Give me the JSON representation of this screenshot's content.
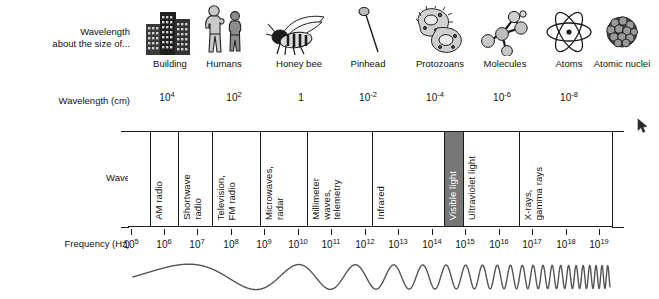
{
  "figure": {
    "background_color": "#ffffff",
    "ink_color": "#111111",
    "visible_light_block_color": "#777777"
  },
  "rows": {
    "size_row_label": "Wavelength\nabout the size of...",
    "wavelength_row_label": "Wavelength (cm)",
    "wave_row_label": "Wave",
    "frequency_row_label": "Frequency (Hz)"
  },
  "size_icons": [
    {
      "icon": "building-icon",
      "caption": "Building",
      "x": 170
    },
    {
      "icon": "humans-icon",
      "caption": "Humans",
      "x": 224
    },
    {
      "icon": "honey-bee-icon",
      "caption": "Honey bee",
      "x": 299
    },
    {
      "icon": "pinhead-icon",
      "caption": "Pinhead",
      "x": 368
    },
    {
      "icon": "protozoans-icon",
      "caption": "Protozoans",
      "x": 440
    },
    {
      "icon": "molecules-icon",
      "caption": "Molecules",
      "x": 505
    },
    {
      "icon": "atoms-icon",
      "caption": "Atoms",
      "x": 569
    },
    {
      "icon": "atomic-nuclei-icon",
      "caption": "Atomic nuclei",
      "x": 622
    }
  ],
  "wavelength_axis": {
    "unit": "cm",
    "ticks": [
      {
        "base": "10",
        "exp": "4",
        "x": 167
      },
      {
        "base": "10",
        "exp": "2",
        "x": 234
      },
      {
        "base": "1",
        "exp": "",
        "x": 301
      },
      {
        "base": "10",
        "exp": "-2",
        "x": 368
      },
      {
        "base": "10",
        "exp": "-4",
        "x": 435
      },
      {
        "base": "10",
        "exp": "-6",
        "x": 502
      },
      {
        "base": "10",
        "exp": "-8",
        "x": 569
      }
    ]
  },
  "frequency_axis": {
    "unit": "Hz",
    "ticks": [
      {
        "base": "10",
        "exp": "5",
        "x": 131
      },
      {
        "base": "10",
        "exp": "6",
        "x": 164
      },
      {
        "base": "10",
        "exp": "7",
        "x": 197
      },
      {
        "base": "10",
        "exp": "8",
        "x": 231
      },
      {
        "base": "10",
        "exp": "9",
        "x": 264
      },
      {
        "base": "10",
        "exp": "10",
        "x": 298
      },
      {
        "base": "10",
        "exp": "11",
        "x": 331
      },
      {
        "base": "10",
        "exp": "12",
        "x": 365
      },
      {
        "base": "10",
        "exp": "13",
        "x": 398
      },
      {
        "base": "10",
        "exp": "14",
        "x": 432
      },
      {
        "base": "10",
        "exp": "15",
        "x": 465
      },
      {
        "base": "10",
        "exp": "16",
        "x": 499
      },
      {
        "base": "10",
        "exp": "17",
        "x": 532
      },
      {
        "base": "10",
        "exp": "18",
        "x": 566
      },
      {
        "base": "10",
        "exp": "19",
        "x": 599
      }
    ]
  },
  "spectrum_bands": [
    {
      "name": "AM radio",
      "label": "AM radio",
      "x_start": 150,
      "x_end": 178,
      "highlight": false
    },
    {
      "name": "Shortwave radio",
      "label": "Shortwave\nradio",
      "x_start": 178,
      "x_end": 212,
      "highlight": false
    },
    {
      "name": "Television, FM radio",
      "label": "Television,\nFM radio",
      "x_start": 212,
      "x_end": 260,
      "highlight": false
    },
    {
      "name": "Microwaves, radar",
      "label": "Microwaves,\nradar",
      "x_start": 260,
      "x_end": 307,
      "highlight": false
    },
    {
      "name": "Millimeter waves telemetry",
      "label": "Millimeter\nwaves,\ntelemetry",
      "x_start": 307,
      "x_end": 372,
      "highlight": false
    },
    {
      "name": "Infrared",
      "label": "Infrared",
      "x_start": 372,
      "x_end": 444,
      "highlight": false
    },
    {
      "name": "Visible light",
      "label": "Visible light",
      "x_start": 444,
      "x_end": 463,
      "highlight": true
    },
    {
      "name": "Ultraviolet light",
      "label": "Ultraviolet light",
      "x_start": 463,
      "x_end": 519,
      "highlight": false
    },
    {
      "name": "X-rays, gamma rays",
      "label": "X-rays,\ngamma rays",
      "x_start": 519,
      "x_end": 613,
      "highlight": false
    }
  ],
  "band_geometry": {
    "left": 128,
    "right": 613,
    "top": 131,
    "bottom": 227
  },
  "wave_illustration": {
    "description": "sine wave with progressively increasing frequency, left to right",
    "x_start": 133,
    "x_end": 610,
    "stroke_color": "#555555"
  },
  "cursor": {
    "icon": "mouse-pointer-icon",
    "x": 637,
    "y": 118
  },
  "chart_data": {
    "type": "diagram",
    "xlabel": "Frequency (Hz) / Wavelength (cm)",
    "ylabel": "",
    "frequency_exponents": [
      5,
      6,
      7,
      8,
      9,
      10,
      11,
      12,
      13,
      14,
      15,
      16,
      17,
      18,
      19
    ],
    "wavelength_exponents": [
      4,
      2,
      0,
      -2,
      -4,
      -6,
      -8
    ],
    "categories": [
      "AM radio",
      "Shortwave radio",
      "Television, FM radio",
      "Microwaves, radar",
      "Millimeter waves, telemetry",
      "Infrared",
      "Visible light",
      "Ultraviolet light",
      "X-rays, gamma rays"
    ],
    "size_comparisons": [
      "Building",
      "Humans",
      "Honey bee",
      "Pinhead",
      "Protozoans",
      "Molecules",
      "Atoms",
      "Atomic nuclei"
    ],
    "grid": false,
    "legend": "none"
  }
}
